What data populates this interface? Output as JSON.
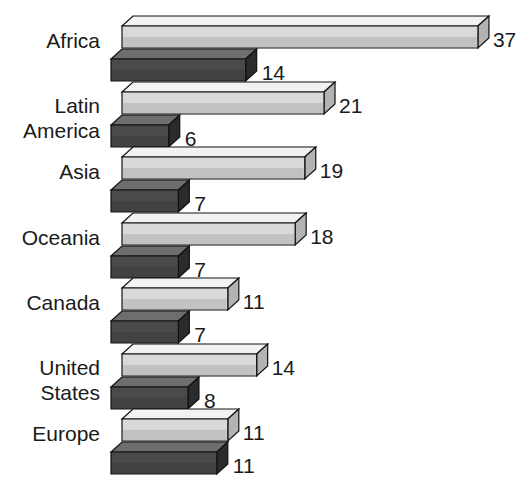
{
  "chart_data": {
    "type": "bar",
    "orientation": "horizontal",
    "style": "3d-bars",
    "title": "",
    "subtitle": "",
    "xlabel": "",
    "ylabel": "",
    "grid": false,
    "legend": null,
    "legend_position": "none",
    "xlim": [
      0,
      40
    ],
    "categories": [
      "Africa",
      "Latin\nAmerica",
      "Asia",
      "Oceania",
      "Canada",
      "United\nStates",
      "Europe"
    ],
    "series": [
      {
        "name": "light-series",
        "color": "#d9d9d9",
        "values": [
          37,
          21,
          19,
          18,
          11,
          14,
          11
        ]
      },
      {
        "name": "dark-series",
        "color": "#4a4a4a",
        "values": [
          14,
          6,
          7,
          7,
          7,
          8,
          11
        ]
      }
    ],
    "data_labels": {
      "light": [
        "37",
        "21",
        "19",
        "18",
        "11",
        "14",
        "11"
      ],
      "dark": [
        "14",
        "6",
        "7",
        "7",
        "7",
        "8",
        "11"
      ]
    }
  },
  "colors": {
    "background": "#ffffff",
    "light_bar_face": "#d9d9d9",
    "light_bar_top": "#f2f2f2",
    "light_bar_side": "#b3b3b3",
    "dark_bar_face": "#4a4a4a",
    "dark_bar_top": "#6e6e6e",
    "dark_bar_side": "#2b2b2b",
    "outline": "#111111",
    "text": "#1a1a1a"
  }
}
